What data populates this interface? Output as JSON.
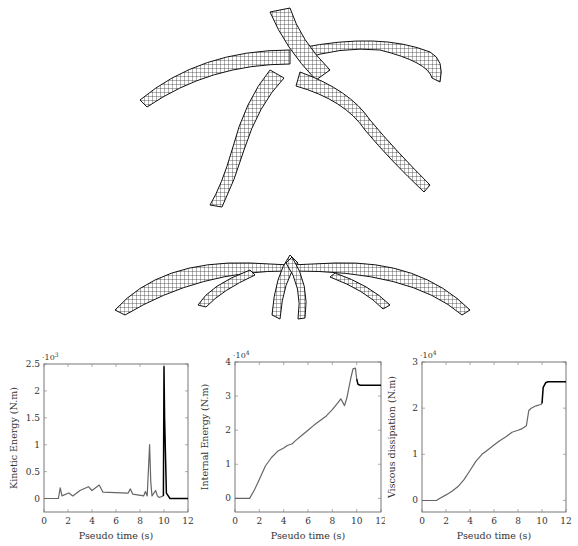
{
  "figure": {
    "panels": [
      {
        "id": "mesh-top",
        "description": "Wireframe mesh, oblique view of five-petal shell structure"
      },
      {
        "id": "mesh-side",
        "description": "Wireframe mesh, side view of five-petal shell structure"
      }
    ]
  },
  "chart_data": [
    {
      "type": "line",
      "title": "",
      "xlabel": "Pseudo time (s)",
      "ylabel": "Kinetic Energy (N.m)",
      "y_multiplier": "·10^3",
      "xlim": [
        0,
        12
      ],
      "ylim": [
        -0.25,
        2.5
      ],
      "xticks": [
        "0",
        "2",
        "4",
        "6",
        "8",
        "10",
        "12"
      ],
      "yticks": [
        "0",
        "0.5",
        "1",
        "1.5",
        "2",
        "2.5"
      ],
      "grid": false,
      "series": [
        {
          "name": "Kinetic energy",
          "x": [
            0,
            1.2,
            1.35,
            1.5,
            2.0,
            2.1,
            2.4,
            3.0,
            3.7,
            4.0,
            4.6,
            4.9,
            7.0,
            7.2,
            7.4,
            8.3,
            8.45,
            8.6,
            8.8,
            8.9,
            9.0,
            9.3,
            9.45,
            9.6,
            9.95,
            10.0,
            10.05,
            10.2,
            10.5,
            12
          ],
          "y": [
            0,
            0,
            0.2,
            0.05,
            0.1,
            0.1,
            0.05,
            0.15,
            0.22,
            0.15,
            0.25,
            0.12,
            0.1,
            0.18,
            0.08,
            0.05,
            0.13,
            0.05,
            1.0,
            0.3,
            0.05,
            0.15,
            0.05,
            0.02,
            0.05,
            2.45,
            1.5,
            0.1,
            0,
            0
          ]
        }
      ]
    },
    {
      "type": "line",
      "title": "",
      "xlabel": "Pseudo time (s)",
      "ylabel": "Internal Energy (N.m)",
      "y_multiplier": "·10^4",
      "xlim": [
        0,
        12
      ],
      "ylim": [
        -0.4,
        4
      ],
      "xticks": [
        "0",
        "2",
        "4",
        "6",
        "8",
        "10",
        "12"
      ],
      "yticks": [
        "0",
        "1",
        "2",
        "3",
        "4"
      ],
      "grid": false,
      "series": [
        {
          "name": "Internal energy",
          "x": [
            0,
            1.2,
            1.6,
            2.0,
            2.5,
            3.0,
            3.5,
            4.0,
            4.3,
            4.7,
            5.0,
            5.5,
            6.0,
            6.5,
            7.0,
            7.5,
            8.0,
            8.5,
            8.7,
            9.0,
            9.2,
            9.5,
            9.7,
            9.9,
            10.0,
            10.1,
            10.3,
            10.5,
            12
          ],
          "y": [
            0,
            0,
            0.25,
            0.55,
            0.95,
            1.2,
            1.38,
            1.48,
            1.55,
            1.6,
            1.7,
            1.85,
            2.0,
            2.15,
            2.28,
            2.42,
            2.6,
            2.82,
            2.92,
            2.72,
            2.95,
            3.5,
            3.8,
            3.82,
            3.5,
            3.35,
            3.32,
            3.32,
            3.32
          ]
        }
      ]
    },
    {
      "type": "line",
      "title": "",
      "xlabel": "Pseudo time (s)",
      "ylabel": "Viscous dissipation (N.m)",
      "y_multiplier": "·10^4",
      "xlim": [
        0,
        12
      ],
      "ylim": [
        -0.25,
        3
      ],
      "xticks": [
        "0",
        "2",
        "4",
        "6",
        "8",
        "10",
        "12"
      ],
      "yticks": [
        "0",
        "1",
        "2",
        "3"
      ],
      "grid": false,
      "series": [
        {
          "name": "Viscous dissipation",
          "x": [
            0,
            1.2,
            1.5,
            2.0,
            2.5,
            3.0,
            3.5,
            4.0,
            4.5,
            5.0,
            5.5,
            6.0,
            6.5,
            7.0,
            7.5,
            8.0,
            8.3,
            8.7,
            8.9,
            9.1,
            9.5,
            9.9,
            10.0,
            10.1,
            10.3,
            10.5,
            12
          ],
          "y": [
            0,
            0,
            0.05,
            0.12,
            0.2,
            0.3,
            0.45,
            0.65,
            0.85,
            1.0,
            1.1,
            1.2,
            1.3,
            1.38,
            1.48,
            1.52,
            1.55,
            1.62,
            1.95,
            2.0,
            2.05,
            2.08,
            2.1,
            2.45,
            2.55,
            2.57,
            2.57
          ]
        }
      ]
    }
  ],
  "labels": {
    "p1": {
      "ylabel": "Kinetic Energy (N.m)",
      "exp": "·10",
      "exp_power": "3",
      "xlabel": "Pseudo time (s)"
    },
    "p2": {
      "ylabel": "Internal Energy (N.m)",
      "exp": "·10",
      "exp_power": "4",
      "xlabel": "Pseudo time (s)"
    },
    "p3": {
      "ylabel": "Viscous dissipation (N.m)",
      "exp": "·10",
      "exp_power": "4",
      "xlabel": "Pseudo time (s)"
    }
  }
}
